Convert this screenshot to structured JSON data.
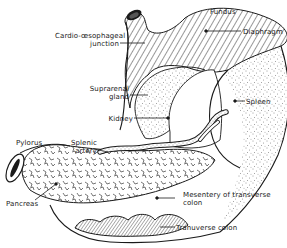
{
  "figure": {
    "colors": {
      "ink": "#1a1a1a",
      "background": "#ffffff"
    }
  },
  "labels": {
    "fundus": "Fundus",
    "diaphragm": "Diaphragm",
    "cardio_line1": "Cardio-œsophageal",
    "cardio_line2": "junction",
    "suprarenal_line1": "Suprarenal",
    "suprarenal_line2": "gland",
    "spleen": "Spleen",
    "kidney": "Kidney",
    "splenic_line1": "Splenic",
    "splenic_line2": "artery",
    "pylorus": "Pylorus",
    "pancreas": "Pancreas",
    "mesentery_line1": "Mesentery of transverse",
    "mesentery_line2": "colon",
    "transverse_colon": "Tranuverse colon"
  }
}
